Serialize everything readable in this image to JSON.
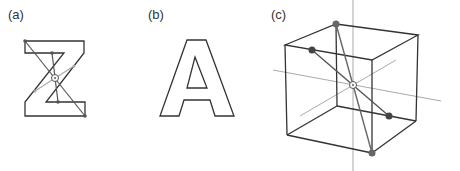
{
  "panels": [
    {
      "label": "(a)",
      "shape": "letter Z with symmetry axes",
      "center_marker": "ring"
    },
    {
      "label": "(b)",
      "shape": "letter A outline"
    },
    {
      "label": "(c)",
      "shape": "cube with inversion center and axes",
      "center_marker": "ring"
    }
  ],
  "colors": {
    "outline": "#333333",
    "axis": "#999999",
    "node": "#555555",
    "diagonal": "#666666"
  }
}
